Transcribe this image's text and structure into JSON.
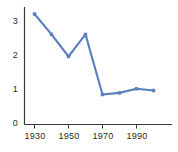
{
  "chart_data": {
    "type": "line",
    "title": "",
    "xlabel": "",
    "ylabel": "",
    "x": [
      1930,
      1940,
      1950,
      1960,
      1970,
      1980,
      1990,
      2000
    ],
    "values": [
      3.25,
      2.65,
      2.0,
      2.65,
      0.88,
      0.93,
      1.05,
      1.0
    ],
    "series": [
      {
        "name": "series-1",
        "values": [
          3.25,
          2.65,
          2.0,
          2.65,
          0.88,
          0.93,
          1.05,
          1.0
        ],
        "color": "#5a7fbe"
      }
    ],
    "xlim": [
      1928,
      2004
    ],
    "ylim": [
      0,
      3.55
    ],
    "xticks": [
      1930,
      1950,
      1970,
      1990
    ],
    "xtick_labels": [
      "1930",
      "1950",
      "1970",
      "1990"
    ],
    "yticks": [
      0,
      1,
      2,
      3
    ],
    "ytick_labels": [
      "3",
      "2",
      "1",
      "0"
    ],
    "grid": false,
    "legend": false,
    "marker": "square",
    "axis_color": "#3a3a3a",
    "line_color": "#5a7fbe"
  },
  "axis": {
    "y_labels": [
      "3",
      "2",
      "1",
      "0"
    ],
    "x_labels": [
      "1930",
      "1950",
      "1970",
      "1990"
    ]
  }
}
